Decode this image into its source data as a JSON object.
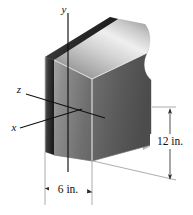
{
  "figure": {
    "kind": "engineering-solid-figure",
    "background_color": "#ffffff",
    "axes": [
      {
        "name": "y",
        "label": "y",
        "direction": "up"
      },
      {
        "name": "z",
        "label": "z",
        "direction": "upper-left"
      },
      {
        "name": "x",
        "label": "x",
        "direction": "lower-left"
      }
    ],
    "dimensions": [
      {
        "name": "width",
        "label": "6 in.",
        "value": 6,
        "unit": "in.",
        "orientation": "horizontal"
      },
      {
        "name": "height",
        "label": "12 in.",
        "value": 12,
        "unit": "in.",
        "orientation": "vertical"
      }
    ],
    "solid": {
      "shape": "rectangular-block",
      "top_face_color_light": "#f2f2f2",
      "top_face_color_dark": "#8c8c8c",
      "front_face_color_light": "#9a9a9a",
      "front_face_color_dark": "#4a4a4a",
      "left_face_color_light": "#6d6d6d",
      "left_face_color_dark": "#202020",
      "right_face_color_light": "#cfcfcf",
      "right_face_color_dark": "#7a7a7a",
      "edge_color": "#d8d8d8",
      "axis_line_color": "#111111",
      "dimension_line_color": "#4a4a4a"
    }
  }
}
